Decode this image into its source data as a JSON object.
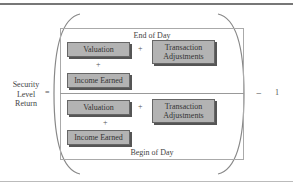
{
  "lhs": {
    "label_lines": [
      "Security",
      "Level",
      "Return"
    ],
    "equals": "="
  },
  "numerator": {
    "caption": "End of Day",
    "boxes": {
      "valuation": "Valuation",
      "transaction_line1": "Transaction",
      "transaction_line2": "Adjustments",
      "income": "Income Earned"
    },
    "plus_right": "+",
    "plus_down": "+"
  },
  "denominator": {
    "caption": "Begin of Day",
    "boxes": {
      "valuation": "Valuation",
      "transaction_line1": "Transaction",
      "transaction_line2": "Adjustments",
      "income": "Income Earned"
    },
    "plus_right": "+",
    "plus_down": "+"
  },
  "rhs": {
    "minus": "−",
    "one": "1"
  },
  "colors": {
    "box_fill": "#b3b3b3",
    "box_border": "#666666",
    "rule": "#777777"
  }
}
